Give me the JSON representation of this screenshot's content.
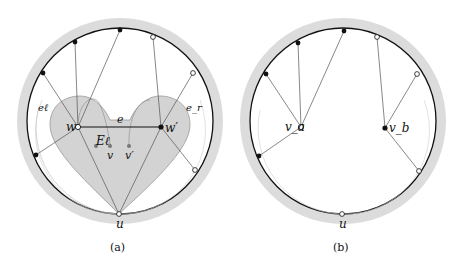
{
  "panels": [
    {
      "id": "a",
      "caption": "(a)",
      "labels": {
        "w": "w",
        "w_prime": "w′",
        "e": "e",
        "E_l": "Eℓ",
        "v": "v",
        "v_prime": "v′",
        "u": "u",
        "e_l": "eℓ",
        "e_r": "e_r"
      }
    },
    {
      "id": "b",
      "caption": "(b)",
      "labels": {
        "v_a": "v_a",
        "v_b": "v_b",
        "u": "u"
      }
    }
  ],
  "colors": {
    "ring": "#dcdcdc",
    "heart": "#d0d0d0",
    "heart_stroke": "#9a9a9a",
    "circle": "#111111",
    "thin": "#8a8a8a"
  }
}
